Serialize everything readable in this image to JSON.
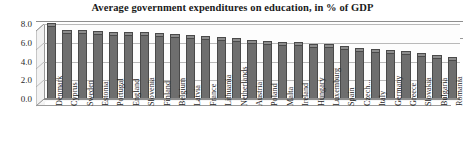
{
  "chart_data": {
    "type": "bar",
    "title": "Average government expenditures on education, in % of GDP",
    "xlabel": "",
    "ylabel": "",
    "ylim": [
      0.0,
      8.0
    ],
    "yticks": [
      "8.0",
      "6.0",
      "4.0",
      "2.0",
      "0.0"
    ],
    "ytick_values": [
      8.0,
      6.0,
      4.0,
      2.0,
      0.0
    ],
    "grid": true,
    "legend_position": "top-right",
    "style": "3d-column",
    "bar_color": "#6e6e6e",
    "series": [
      {
        "name": "2008-2012",
        "values": [
          7.8,
          7.0,
          7.0,
          6.9,
          6.8,
          6.8,
          6.8,
          6.7,
          6.6,
          6.5,
          6.4,
          6.3,
          6.2,
          6.0,
          5.9,
          5.8,
          5.8,
          5.6,
          5.5,
          5.3,
          5.1,
          5.0,
          4.9,
          4.8,
          4.6,
          4.4,
          4.2
        ]
      }
    ],
    "categories": [
      "Denmark",
      "Cyprus",
      "Sweden",
      "Estonia",
      "Portugal",
      "England",
      "Slovenia",
      "Finland",
      "Belgium",
      "Latvia",
      "France",
      "Lithuania",
      "Netherlands",
      "Austria",
      "Poland",
      "Malta",
      "Ireland",
      "Hungary",
      "Luxemburg",
      "Spain",
      "Czech...",
      "Italy",
      "Germany",
      "Greece",
      "Slovakia",
      "Bulgaria",
      "Romania"
    ]
  },
  "legend": {
    "entries": [
      {
        "label": "2008-2012",
        "color": "#5d5d5d"
      }
    ]
  }
}
